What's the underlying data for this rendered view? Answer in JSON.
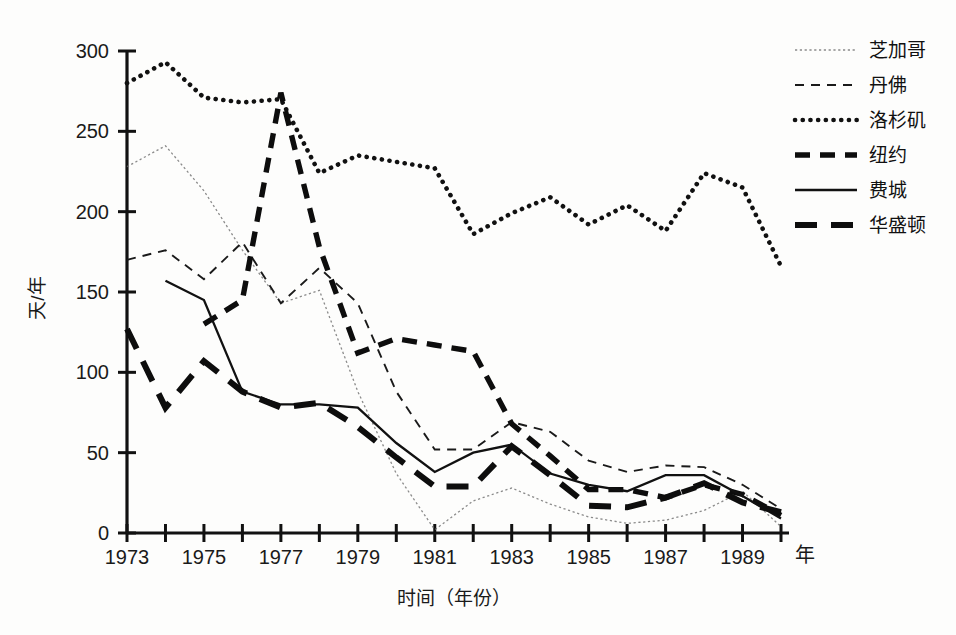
{
  "chart_data": {
    "type": "line",
    "title": "",
    "xlabel": "时间（年份）",
    "ylabel": "天/年",
    "x_axis_unit_label": "年",
    "xlim": [
      1973,
      1990
    ],
    "ylim": [
      0,
      300
    ],
    "x_tick_values": [
      1973,
      1975,
      1977,
      1979,
      1981,
      1983,
      1985,
      1987,
      1989
    ],
    "x_tick_labels": [
      "1973",
      "1975",
      "1977",
      "1979",
      "1981",
      "1983",
      "1985",
      "1987",
      "1989"
    ],
    "x_minor_ticks": [
      1974,
      1976,
      1978,
      1980,
      1982,
      1984,
      1986,
      1988,
      1990
    ],
    "y_tick_values": [
      0,
      50,
      100,
      150,
      200,
      250,
      300
    ],
    "y_tick_labels": [
      "0",
      "50",
      "100",
      "150",
      "200",
      "250",
      "300"
    ],
    "grid": false,
    "legend_position": "top-right",
    "x": [
      1973,
      1974,
      1975,
      1976,
      1977,
      1978,
      1979,
      1980,
      1981,
      1982,
      1983,
      1984,
      1985,
      1986,
      1987,
      1988,
      1989,
      1990
    ],
    "series": [
      {
        "name": "芝加哥",
        "legend_style": "thin-solid",
        "color": "#6e6e6e",
        "values": [
          228,
          241,
          213,
          176,
          143,
          151,
          88,
          37,
          2,
          20,
          28,
          18,
          10,
          6,
          8,
          14,
          26,
          4
        ]
      },
      {
        "name": "丹佛",
        "legend_style": "thin-dashed",
        "color": "#1a1a1a",
        "values": [
          170,
          176,
          158,
          181,
          143,
          165,
          143,
          88,
          52,
          52,
          69,
          63,
          45,
          38,
          42,
          41,
          30,
          15
        ]
      },
      {
        "name": "洛杉矶",
        "legend_style": "dotted",
        "color": "#111111",
        "values": [
          280,
          293,
          271,
          268,
          270,
          224,
          235,
          231,
          227,
          186,
          199,
          209,
          192,
          204,
          188,
          224,
          215,
          166
        ]
      },
      {
        "name": "纽约",
        "legend_style": "thick-dashed",
        "color": "#0d0d0d",
        "values": [
          null,
          null,
          130,
          145,
          274,
          178,
          112,
          121,
          117,
          113,
          68,
          48,
          27,
          27,
          22,
          30,
          24,
          11
        ]
      },
      {
        "name": "费城",
        "legend_style": "medium-solid",
        "color": "#111111",
        "values": [
          null,
          157,
          145,
          88,
          80,
          80,
          78,
          56,
          38,
          50,
          55,
          37,
          30,
          26,
          36,
          36,
          23,
          9
        ]
      },
      {
        "name": "华盛顿",
        "legend_style": "thick-long-dashed",
        "color": "#0d0d0d",
        "values": [
          127,
          78,
          107,
          88,
          78,
          81,
          66,
          47,
          29,
          29,
          54,
          36,
          17,
          16,
          22,
          31,
          19,
          13
        ]
      }
    ],
    "legend_entries": [
      {
        "label": "芝加哥",
        "style": "thin-solid"
      },
      {
        "label": "丹佛",
        "style": "thin-dashed"
      },
      {
        "label": "洛杉矶",
        "style": "dotted"
      },
      {
        "label": "纽约",
        "style": "thick-dashed"
      },
      {
        "label": "费城",
        "style": "medium-solid"
      },
      {
        "label": "华盛顿",
        "style": "thick-long-dashed"
      }
    ]
  },
  "plot_geometry": {
    "x_left_px": 127,
    "x_right_px": 781,
    "y_zero_px": 533,
    "y_top_px": 51,
    "y_max_value": 300
  }
}
